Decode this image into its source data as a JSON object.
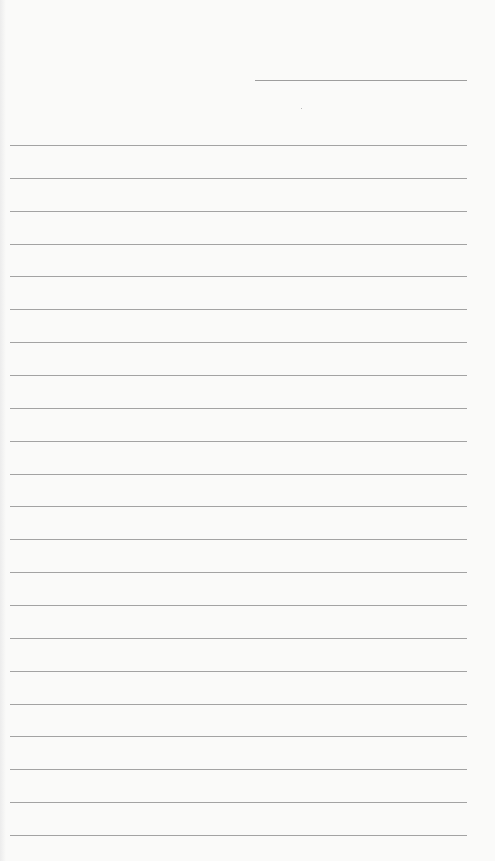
{
  "document": {
    "type": "lined-notepaper",
    "header": {
      "date_field": ""
    },
    "lines": [
      "",
      "",
      "",
      "",
      "",
      "",
      "",
      "",
      "",
      "",
      "",
      "",
      "",
      "",
      "",
      "",
      "",
      "",
      "",
      "",
      "",
      ""
    ],
    "colors": {
      "paper": "#fafaf9",
      "rule": "#a3a3a3"
    }
  }
}
